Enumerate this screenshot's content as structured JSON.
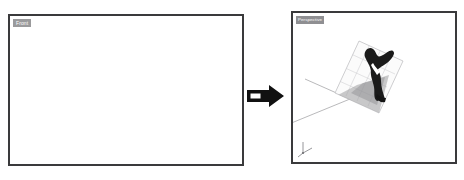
{
  "app": {
    "background_color": "#ffffff",
    "frame_border_color": "#3a3a3c",
    "label_chip_color": "#9a9a9c",
    "label_text_color": "#ffffff"
  },
  "viewports": [
    {
      "id": "front",
      "label": "Front",
      "state": "empty",
      "content_description": "Empty white orthographic front view with no geometry"
    },
    {
      "id": "perspective",
      "label": "Perspective",
      "state": "populated",
      "content_description": "Perspective view containing a tilted translucent grid ground plane, a dark 3D object standing on it casting a gray shadow, a thin gray angled polyline, and an axis gizmo"
    }
  ],
  "transition": {
    "icon": "right-arrow-icon",
    "arrow_fill": "#111111",
    "arrow_notch_fill": "#ffffff",
    "direction": "right",
    "meaning": "Front view transforms into Perspective view"
  },
  "scene": {
    "polyline": {
      "name": "angled-guide-line",
      "color": "#9b9b9e",
      "points": "12,66 57,86 -4,111"
    },
    "grid_plane": {
      "name": "ground-grid-plane",
      "fill": "#fbfbfb",
      "stroke": "#b9b9bc",
      "grid_stroke": "#c9c9cc",
      "rotation_deg": -28
    },
    "object": {
      "name": "dark-3d-model",
      "fill": "#1a1a1a",
      "highlight": "#ffffff"
    },
    "shadow": {
      "name": "cast-shadow",
      "fill": "#9e9ea1",
      "opacity": 0.55
    },
    "axis_gizmo": {
      "name": "axis-gizmo",
      "color": "#7c7c80",
      "axes": [
        "x",
        "y",
        "z"
      ]
    }
  }
}
